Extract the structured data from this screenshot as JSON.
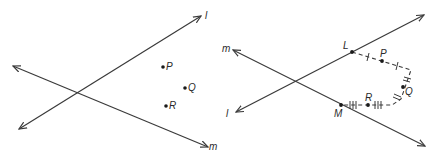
{
  "figure": {
    "left_panel": {
      "lines": [
        {
          "name": "l",
          "label": "l"
        },
        {
          "name": "m",
          "label": "m"
        }
      ],
      "points": [
        {
          "name": "P",
          "label": "P"
        },
        {
          "name": "Q",
          "label": "Q"
        },
        {
          "name": "R",
          "label": "R"
        }
      ]
    },
    "right_panel": {
      "lines": [
        {
          "name": "m",
          "label": "m"
        },
        {
          "name": "l",
          "label": "l"
        }
      ],
      "points": [
        {
          "name": "L",
          "label": "L"
        },
        {
          "name": "P",
          "label": "P"
        },
        {
          "name": "Q",
          "label": "Q"
        },
        {
          "name": "R",
          "label": "R"
        },
        {
          "name": "M",
          "label": "M"
        }
      ],
      "segment_marks": {
        "LP_PQ": "single tick",
        "Q": "double tick",
        "MR_R": "triple tick"
      }
    },
    "stroke_color": "#3a3a3a"
  }
}
